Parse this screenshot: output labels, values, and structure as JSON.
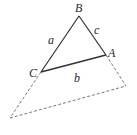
{
  "diagram": {
    "type": "triangle-with-extension",
    "stroke_color": "#333333",
    "dashed_color": "#555555",
    "vertices": {
      "B": {
        "label": "B",
        "x": 79,
        "y": 16
      },
      "A": {
        "label": "A",
        "x": 106,
        "y": 55
      },
      "C": {
        "label": "C",
        "x": 41,
        "y": 72
      }
    },
    "extension_points": {
      "lower_right": {
        "x": 126,
        "y": 86
      },
      "lower_left": {
        "x": 10,
        "y": 118
      }
    },
    "sides": {
      "a": {
        "label": "a",
        "between": "B-C"
      },
      "b": {
        "label": "b",
        "between": "C-A"
      },
      "c": {
        "label": "c",
        "between": "B-A"
      }
    },
    "labels": {
      "B": "B",
      "A": "A",
      "C": "C",
      "a": "a",
      "b": "b",
      "c": "c"
    }
  }
}
